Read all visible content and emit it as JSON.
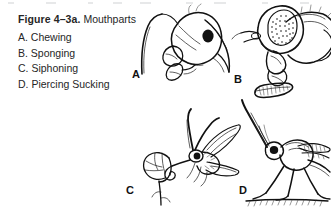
{
  "figure": {
    "number_label": "Figure 4–3a.",
    "subject": "Mouthparts",
    "items": [
      {
        "letter": "A.",
        "label": "A. Chewing"
      },
      {
        "letter": "B.",
        "label": "B. Sponging"
      },
      {
        "letter": "C.",
        "label": "C. Siphoning"
      },
      {
        "letter": "D.",
        "label": "D. Piercing Sucking"
      }
    ]
  },
  "panels": [
    {
      "letter": "A",
      "mouthpart_type": "Chewing",
      "subject": "ant head in profile with mandibles",
      "icon": "insect-head-chewing-illustration"
    },
    {
      "letter": "B",
      "mouthpart_type": "Sponging",
      "subject": "house fly head with compound eye and labellum",
      "icon": "fly-head-sponging-illustration"
    },
    {
      "letter": "C",
      "mouthpart_type": "Siphoning",
      "subject": "butterfly with coiled proboscis at a flower",
      "icon": "butterfly-siphoning-illustration"
    },
    {
      "letter": "D",
      "mouthpart_type": "Piercing Sucking",
      "subject": "mosquito with elongate piercing proboscis",
      "icon": "mosquito-piercing-sucking-illustration"
    }
  ],
  "colors": {
    "background": "#ffffff",
    "text": "#262626",
    "ink": "#111111"
  }
}
